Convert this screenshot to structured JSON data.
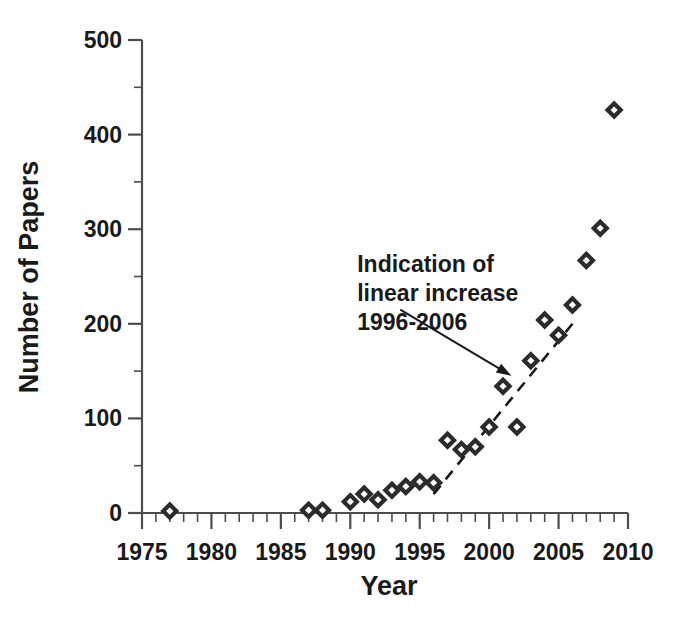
{
  "chart_data": {
    "type": "scatter",
    "title": "",
    "xlabel": "Year",
    "ylabel": "Number of Papers",
    "xlim": [
      1975,
      2010
    ],
    "ylim": [
      0,
      500
    ],
    "xticks": [
      1975,
      1980,
      1985,
      1990,
      1995,
      2000,
      2005,
      2010
    ],
    "xtick_labels": [
      "1975",
      "1980",
      "1985",
      "1990",
      "1995",
      "2000",
      "2005",
      "2010"
    ],
    "x_minor_interval": 1,
    "yticks": [
      0,
      100,
      200,
      300,
      400,
      500
    ],
    "ytick_labels": [
      "0",
      "100",
      "200",
      "300",
      "400",
      "500"
    ],
    "y_minor_interval": 50,
    "grid": false,
    "legend": false,
    "marker": "open-diamond",
    "marker_color": "#2b2b2b",
    "series": [
      {
        "name": "Number of Papers",
        "points": [
          {
            "x": 1977,
            "y": 2
          },
          {
            "x": 1987,
            "y": 3
          },
          {
            "x": 1988,
            "y": 3
          },
          {
            "x": 1990,
            "y": 12
          },
          {
            "x": 1991,
            "y": 20
          },
          {
            "x": 1992,
            "y": 14
          },
          {
            "x": 1993,
            "y": 24
          },
          {
            "x": 1994,
            "y": 28
          },
          {
            "x": 1995,
            "y": 33
          },
          {
            "x": 1996,
            "y": 32
          },
          {
            "x": 1997,
            "y": 77
          },
          {
            "x": 1998,
            "y": 67
          },
          {
            "x": 1999,
            "y": 70
          },
          {
            "x": 2000,
            "y": 91
          },
          {
            "x": 2001,
            "y": 134
          },
          {
            "x": 2002,
            "y": 91
          },
          {
            "x": 2003,
            "y": 161
          },
          {
            "x": 2004,
            "y": 204
          },
          {
            "x": 2005,
            "y": 188
          },
          {
            "x": 2006,
            "y": 220
          },
          {
            "x": 2007,
            "y": 267
          },
          {
            "x": 2008,
            "y": 301
          },
          {
            "x": 2009,
            "y": 426
          }
        ]
      }
    ],
    "trend_line": {
      "name": "Indication of linear increase 1996-2006",
      "style": "dashed",
      "x_start": 1996,
      "y_start": 20,
      "x_end": 2006,
      "y_end": 200
    },
    "annotation": {
      "lines": [
        "Indication of",
        "linear increase",
        "1996-2006"
      ],
      "text_x": 1990.5,
      "text_y": 255,
      "arrow_from_x": 1993.6,
      "arrow_from_y": 215,
      "arrow_to_x": 2001.6,
      "arrow_to_y": 145
    }
  },
  "axis_titles": {
    "x": "Year",
    "y": "Number of Papers"
  }
}
